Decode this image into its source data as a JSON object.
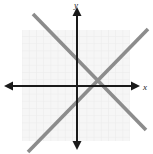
{
  "figure": {
    "width": 153,
    "height": 154,
    "background": "#ffffff",
    "type": "coordinate-plane-graph"
  },
  "axes": {
    "x_label": "x",
    "y_label": "y",
    "color": "#1a1a1a",
    "stroke_width": 2,
    "origin": {
      "x": 77,
      "y": 86
    },
    "x_axis": {
      "x1": 7,
      "y1": 86,
      "x2": 136,
      "y2": 86
    },
    "y_axis": {
      "x1": 77,
      "y1": 10,
      "x2": 77,
      "y2": 146
    },
    "arrowheads": [
      "left",
      "right",
      "up",
      "down"
    ]
  },
  "grid": {
    "color": "#ebebeb",
    "fill": "#f6f6f6",
    "left": 22,
    "top": 30,
    "width": 108,
    "height": 111,
    "cell_size": 7.2,
    "columns": 15,
    "rows": 15,
    "visible": true
  },
  "chart_data": {
    "type": "line",
    "title": "",
    "xlabel": "x",
    "ylabel": "y",
    "grid": true,
    "legend": "none",
    "xlim": [
      -10,
      10
    ],
    "ylim": [
      -10,
      10
    ],
    "series": [
      {
        "name": "descending-line",
        "color": "#8c8c8c",
        "stroke_width": 3.6,
        "slope": "negative",
        "points": [
          {
            "x": 33,
            "y": 14
          },
          {
            "x": 146,
            "y": 130
          }
        ]
      },
      {
        "name": "ascending-line",
        "color": "#8c8c8c",
        "stroke_width": 3.6,
        "slope": "positive",
        "points": [
          {
            "x": 28,
            "y": 152
          },
          {
            "x": 148,
            "y": 29
          }
        ]
      }
    ],
    "intersection": {
      "x": 96,
      "y": 86
    }
  }
}
